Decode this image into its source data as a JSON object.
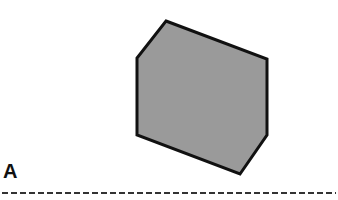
{
  "figure": {
    "shape": {
      "type": "hexagon",
      "fill": "#9a9a9a",
      "stroke": "#111111",
      "points": [
        [
          166,
          21
        ],
        [
          267,
          59
        ],
        [
          267,
          135
        ],
        [
          240,
          174
        ],
        [
          137,
          135
        ],
        [
          137,
          58
        ]
      ]
    },
    "line_label": "A",
    "line": {
      "style": "dashed",
      "y": 193,
      "x1": 2,
      "x2": 336,
      "color": "#333333"
    }
  }
}
